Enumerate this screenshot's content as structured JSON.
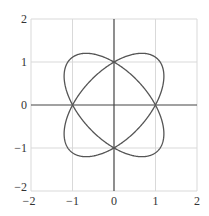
{
  "chart_data": {
    "type": "line",
    "title": "",
    "xlabel": "",
    "ylabel": "",
    "xlim": [
      -2,
      2
    ],
    "ylim": [
      -2,
      2
    ],
    "grid": true,
    "legend": null,
    "x_ticks": [
      -2,
      -1,
      0,
      1,
      2
    ],
    "y_ticks": [
      -2,
      -1,
      0,
      1,
      2
    ],
    "x_tick_labels": [
      "−2",
      "−1",
      "0",
      "1",
      "2"
    ],
    "y_tick_labels": [
      "−2",
      "−1",
      "0",
      "1",
      "2"
    ],
    "series": [
      {
        "name": "ellipse +45deg",
        "kind": "ellipse",
        "center": [
          0,
          0
        ],
        "semi_major": 1.5,
        "semi_minor": 0.8,
        "rotation_deg": 45
      },
      {
        "name": "ellipse -45deg",
        "kind": "ellipse",
        "center": [
          0,
          0
        ],
        "semi_major": 1.5,
        "semi_minor": 0.8,
        "rotation_deg": -45
      }
    ],
    "intersection_points": [
      [
        1,
        0
      ],
      [
        0,
        1
      ],
      [
        -1,
        0
      ],
      [
        0,
        -1
      ]
    ]
  },
  "colors": {
    "curve": "#555555",
    "axis": "#444444",
    "grid": "#d9d9d9",
    "frame": "#cccccc"
  }
}
